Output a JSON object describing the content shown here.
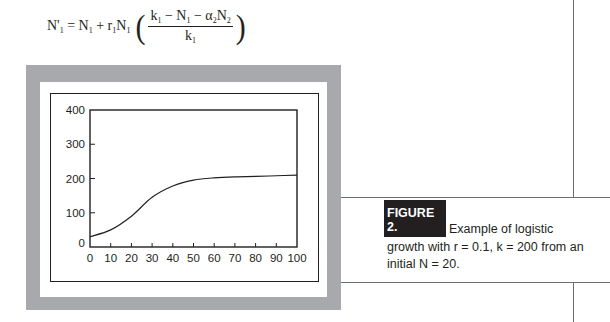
{
  "equation": {
    "lhs": "N'",
    "lhs_sub": "1",
    "equals": "=",
    "term1": "N",
    "term1_sub": "1",
    "plus": "+",
    "term2_r": "r",
    "term2_r_sub": "1",
    "term2_n": "N",
    "term2_n_sub": "1",
    "numerator": {
      "k": "k",
      "k_sub": "1",
      "minus1": "−",
      "n": "N",
      "n_sub": "1",
      "minus2": "−",
      "alpha": "α",
      "alpha_sub": "2",
      "n2": "N",
      "n2_sub": "2"
    },
    "denominator": {
      "k": "k",
      "k_sub": "1"
    }
  },
  "figure": {
    "label": "FIGURE 2.",
    "caption": "Example of logistic growth with r = 0.1, k = 200 from an initial N = 20.",
    "caption_line1": "Example of logistic",
    "caption_line2": "growth with r = 0.1, k = 200 from an",
    "caption_line3": "initial N = 20."
  },
  "colors": {
    "frame_gray": "#a7a9ac",
    "ink": "#231f20",
    "label_bg": "#231f20",
    "label_text": "#ffffff",
    "rule": "#6d6e71"
  },
  "chart_data": {
    "type": "line",
    "title": "",
    "xlabel": "",
    "ylabel": "",
    "x": [
      0,
      10,
      20,
      30,
      40,
      50,
      60,
      70,
      80,
      90,
      100
    ],
    "series": [
      {
        "name": "N",
        "values": [
          30,
          50,
          90,
          145,
          178,
          195,
          202,
          205,
          206,
          208,
          210
        ]
      }
    ],
    "xlim": [
      0,
      100
    ],
    "ylim": [
      0,
      400
    ],
    "xticks": [
      0,
      10,
      20,
      30,
      40,
      50,
      60,
      70,
      80,
      90,
      100
    ],
    "yticks": [
      0,
      100,
      200,
      300,
      400
    ],
    "xtick_labels": [
      "0",
      "10",
      "20",
      "30",
      "40",
      "50",
      "60",
      "70",
      "80",
      "90",
      "100"
    ],
    "ytick_labels": [
      "0",
      "100",
      "200",
      "300",
      "400"
    ],
    "grid": false,
    "legend": null
  }
}
